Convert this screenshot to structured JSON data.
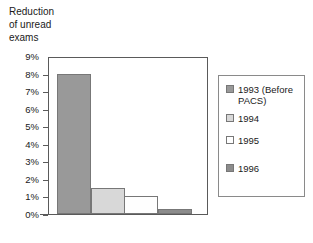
{
  "chart_data": {
    "type": "bar",
    "title": "Reduction\nof unread\nexams",
    "xlabel": "",
    "ylabel": "",
    "ylim": [
      0,
      9
    ],
    "ytick_labels": [
      "9%",
      "8%",
      "7%",
      "6%",
      "5%",
      "4%",
      "3%",
      "2%",
      "1%",
      "0%"
    ],
    "ytick_values": [
      9,
      8,
      7,
      6,
      5,
      4,
      3,
      2,
      1,
      0
    ],
    "grid": false,
    "legend_position": "right",
    "categories": [
      "1993 (Before PACS)",
      "1994",
      "1995",
      "1996"
    ],
    "values": [
      8.0,
      1.5,
      1.0,
      0.3
    ],
    "series": [
      {
        "name": "Reduction of unread exams",
        "values": [
          8.0,
          1.5,
          1.0,
          0.3
        ]
      }
    ],
    "bars": [
      {
        "label": "1993 (Before\nPACS)",
        "value": 8.0,
        "color": "#999999"
      },
      {
        "label": "1994",
        "value": 1.5,
        "color": "#d8d8d8"
      },
      {
        "label": "1995",
        "value": 1.0,
        "color": "#fefefe"
      },
      {
        "label": "1996",
        "value": 0.3,
        "color": "#8c8c8c"
      }
    ],
    "colors": {
      "bar_1993": "#999999",
      "bar_1994": "#d8d8d8",
      "bar_1995": "#fefefe",
      "bar_1996": "#8c8c8c",
      "axis": "#5a5a5a",
      "bar_border": "#777777",
      "legend_border": "#8a8a8a",
      "text": "#1a1a1a",
      "background": "#ffffff"
    },
    "legend": [
      {
        "label": "1993 (Before\nPACS)",
        "color": "#999999"
      },
      {
        "label": "1994",
        "color": "#d8d8d8"
      },
      {
        "label": "1995",
        "color": "#fefefe"
      },
      {
        "label": "1996",
        "color": "#8c8c8c"
      }
    ]
  }
}
